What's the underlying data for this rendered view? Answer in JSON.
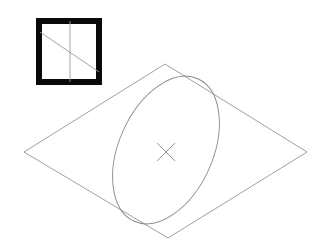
{
  "figure": {
    "background_color": "#ffffff",
    "line_color": "#8a8a8a",
    "frame_color": "#0a0a0a",
    "width": 329,
    "height": 252
  },
  "inset": {
    "name": "orientation-key",
    "frame": {
      "x": 36,
      "y": 18,
      "width": 66,
      "height": 67,
      "border_width": 6
    },
    "vertical_line": {
      "x1": 70,
      "y1": 21,
      "x2": 70,
      "y2": 82
    },
    "diagonal_line": {
      "x1": 40,
      "y1": 32,
      "x2": 99,
      "y2": 72
    }
  },
  "plane": {
    "name": "projected-plane",
    "shape": "rhombus",
    "vertices": [
      {
        "label": "left",
        "x": 24,
        "y": 152
      },
      {
        "label": "top",
        "x": 165,
        "y": 64
      },
      {
        "label": "right",
        "x": 307,
        "y": 152
      },
      {
        "label": "bottom",
        "x": 168,
        "y": 238
      }
    ]
  },
  "ellipse": {
    "name": "inscribed-ellipse",
    "center": {
      "x": 166,
      "y": 150
    },
    "radius_major": 78,
    "radius_minor": 47,
    "rotation_deg": -66
  },
  "center_mark": {
    "name": "center-cross",
    "center": {
      "x": 166,
      "y": 152
    },
    "arm_length": 9,
    "glyph": "x-mark"
  }
}
